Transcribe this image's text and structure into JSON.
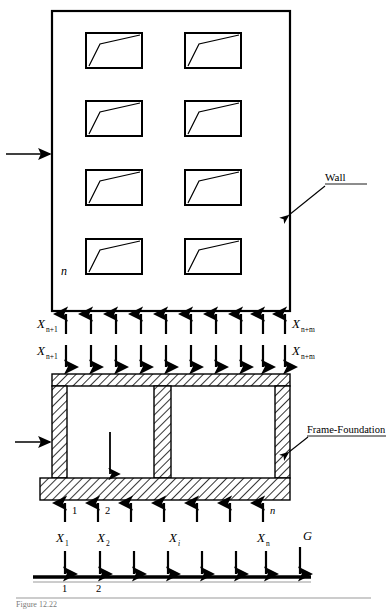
{
  "figure": {
    "type": "structural-engineering-diagram"
  },
  "annotations": {
    "wall_label": "Wall",
    "frame_label": "Frame-Foundation",
    "wall_index_n": "n",
    "caption_partial": "Figure 12.22"
  },
  "wall": {
    "window_rows": 4,
    "window_cols": 2,
    "lateral_load_arrow": "horizontal-load-arrow"
  },
  "interface_upper": {
    "left_label_base": "X",
    "left_label_sub": "n+1",
    "right_label_base": "X",
    "right_label_sub": "n+m",
    "arrow_count": 10,
    "direction": "up"
  },
  "interface_lower": {
    "left_label_base": "X",
    "left_label_sub": "n+1",
    "right_label_base": "X",
    "right_label_sub": "n+m",
    "arrow_count": 10,
    "direction": "down"
  },
  "foundation_reactions": {
    "arrow_count": 7,
    "direction": "up",
    "tick_labels": [
      "1",
      "2",
      "n"
    ]
  },
  "soil_loads": {
    "arrow_count": 8,
    "direction": "down",
    "labels": [
      {
        "base": "X",
        "sub": "1"
      },
      {
        "base": "X",
        "sub": "2"
      },
      {
        "base": "X",
        "sub": "i"
      },
      {
        "base": "X",
        "sub": "n"
      },
      {
        "base": "G",
        "sub": ""
      }
    ],
    "ground_tick_labels": [
      "1",
      "2"
    ]
  },
  "colors": {
    "line": "#000000",
    "hatch": "#000000",
    "hatch_fill": "#ffffff",
    "background": "#ffffff",
    "caption": "#7a7a7a"
  }
}
